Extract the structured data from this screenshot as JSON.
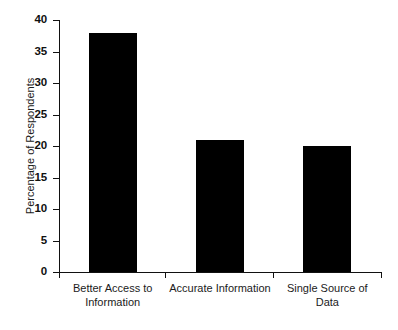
{
  "chart_data": {
    "type": "bar",
    "title": "",
    "subtitle": "",
    "xlabel": "",
    "ylabel": "Percentage of Respondents",
    "categories": [
      "Better Access to\nInformation",
      "Accurate Information",
      "Single Source of\nData"
    ],
    "values": [
      38,
      21,
      20
    ],
    "ylim": [
      0,
      40
    ],
    "yticks": [
      0,
      5,
      10,
      15,
      20,
      25,
      30,
      35,
      40
    ],
    "ytick_labels": [
      "0",
      "5",
      "10",
      "15",
      "20",
      "25",
      "30",
      "35",
      "40"
    ],
    "grid": false,
    "legend": false,
    "legend_position": "none",
    "bar_color": "#000000",
    "axis_color": "#111111",
    "background_color": "#ffffff",
    "orientation": "vertical"
  }
}
